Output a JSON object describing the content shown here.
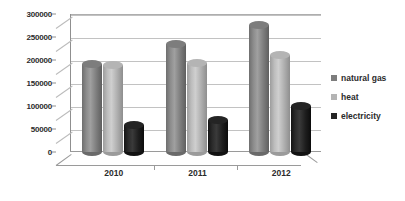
{
  "chart_data": {
    "type": "bar",
    "title": "",
    "xlabel": "",
    "ylabel": "",
    "categories": [
      "2010",
      "2011",
      "2012"
    ],
    "series": [
      {
        "name": "natural gas",
        "color": "#7d7d7d",
        "values": [
          200000,
          243000,
          285000
        ]
      },
      {
        "name": "heat",
        "color": "#b4b4b4",
        "values": [
          198000,
          203000,
          220000
        ]
      },
      {
        "name": "electricity",
        "color": "#242424",
        "values": [
          68000,
          78000,
          108000
        ]
      }
    ],
    "ylim": [
      0,
      300000
    ],
    "ytick_step": 50000,
    "yticks": [
      "0",
      "50000",
      "100000",
      "150000",
      "200000",
      "250000",
      "300000"
    ],
    "grid": true,
    "legend_position": "right",
    "style": "3d-cylinder"
  },
  "legend": {
    "items": [
      {
        "label": "natural gas"
      },
      {
        "label": "heat"
      },
      {
        "label": "electricity"
      }
    ]
  }
}
